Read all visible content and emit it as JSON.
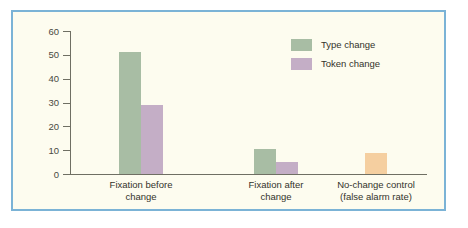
{
  "figure": {
    "background_color": "#fdfcef",
    "border_color": "#7bb3d6"
  },
  "chart_data": {
    "type": "bar",
    "title": "",
    "subtitle": "",
    "xlabel": "",
    "ylabel": "",
    "ylim": [
      0,
      60
    ],
    "yticks": [
      0,
      10,
      20,
      30,
      40,
      50,
      60
    ],
    "ytick_labels": [
      "0",
      "10",
      "20",
      "30",
      "40",
      "50",
      "60"
    ],
    "grid": false,
    "legend_position": "upper right",
    "categories": [
      "Fixation before\nchange",
      "Fixation after\nchange",
      "No-change control\n(false alarm rate)"
    ],
    "series": [
      {
        "name": "Type change",
        "color": "#a8bda4",
        "values": [
          51,
          10.5,
          null
        ]
      },
      {
        "name": "Token change",
        "color": "#c4aec6",
        "values": [
          29,
          5,
          null
        ]
      },
      {
        "name": "No-change control",
        "color": "#f5cfa0",
        "values": [
          null,
          null,
          9
        ],
        "in_legend": false
      }
    ],
    "legend": [
      {
        "label": "Type change",
        "color": "#a8bda4"
      },
      {
        "label": "Token change",
        "color": "#c4aec6"
      }
    ],
    "annotations": []
  },
  "axis": {
    "tick_color": "#6f6f63",
    "label_color": "#33332b"
  }
}
